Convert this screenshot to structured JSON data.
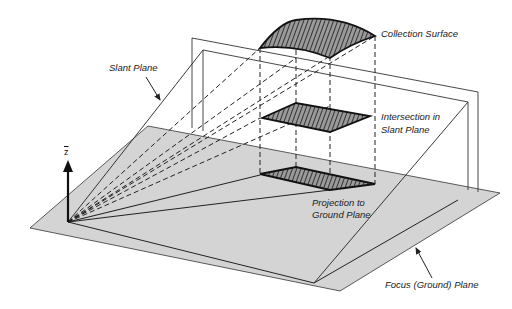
{
  "diagram": {
    "labels": {
      "collection_surface": "Collection Surface",
      "slant_plane": "Slant Plane",
      "intersection_line1": "Intersection in",
      "intersection_line2": "Slant Plane",
      "projection_line1": "Projection to",
      "projection_line2": "Ground Plane",
      "focus_ground_plane": "Focus (Ground) Plane",
      "z_axis": "z"
    },
    "colors": {
      "ground_plane_fill": "#d4d4d4",
      "line": "#222222",
      "hatch_fill": "#555555",
      "background": "#ffffff"
    }
  }
}
